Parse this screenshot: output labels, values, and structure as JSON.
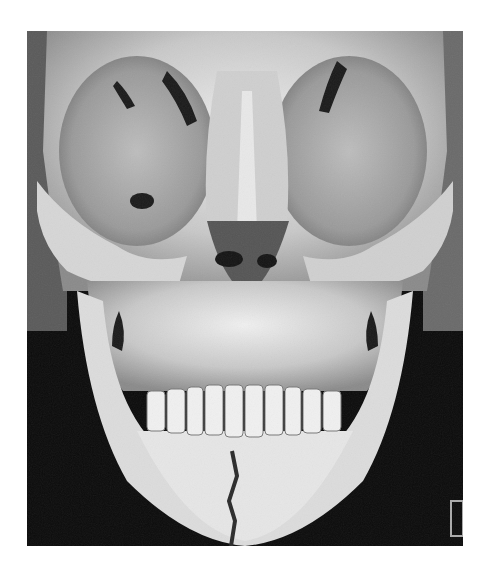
{
  "image": {
    "subject": "3D CT reconstruction of skull, frontal view",
    "palette": {
      "background": "#0b0b0b",
      "bone_light": "#e8e8e8",
      "bone_mid": "#b5b5b5",
      "bone_shadow": "#6e6e6e",
      "cavity": "#1a1a1a"
    },
    "marker_label": ""
  }
}
